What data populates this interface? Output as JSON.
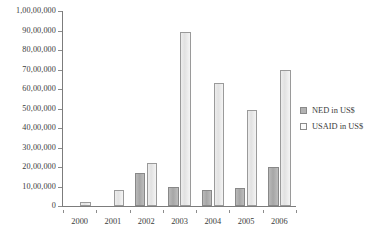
{
  "chart_data": {
    "type": "bar",
    "title": "",
    "subtitle": "",
    "xlabel": "",
    "ylabel": "",
    "categories": [
      "2000",
      "2001",
      "2002",
      "2003",
      "2004",
      "2005",
      "2006"
    ],
    "series": [
      {
        "name": "NED in US$",
        "color": "#b2b2b2",
        "values": [
          0,
          0,
          1700000,
          1000000,
          800000,
          900000,
          2000000
        ]
      },
      {
        "name": "USAID in US$",
        "color": "#ededed",
        "values": [
          200000,
          800000,
          2200000,
          8900000,
          6300000,
          4900000,
          7000000
        ]
      }
    ],
    "ylim": [
      0,
      10000000
    ],
    "ytick_values": [
      0,
      1000000,
      2000000,
      3000000,
      4000000,
      5000000,
      6000000,
      7000000,
      8000000,
      9000000,
      10000000
    ],
    "ytick_labels": [
      "0",
      "10,00,000",
      "20,00,000",
      "30,00,000",
      "40,00,000",
      "50,00,000",
      "60,00,000",
      "70,00,000",
      "80,00,000",
      "90,00,000",
      "1,00,00,000"
    ],
    "grid": false,
    "legend_position": "right",
    "legend_entries": [
      "NED in US$",
      "USAID in US$"
    ]
  }
}
